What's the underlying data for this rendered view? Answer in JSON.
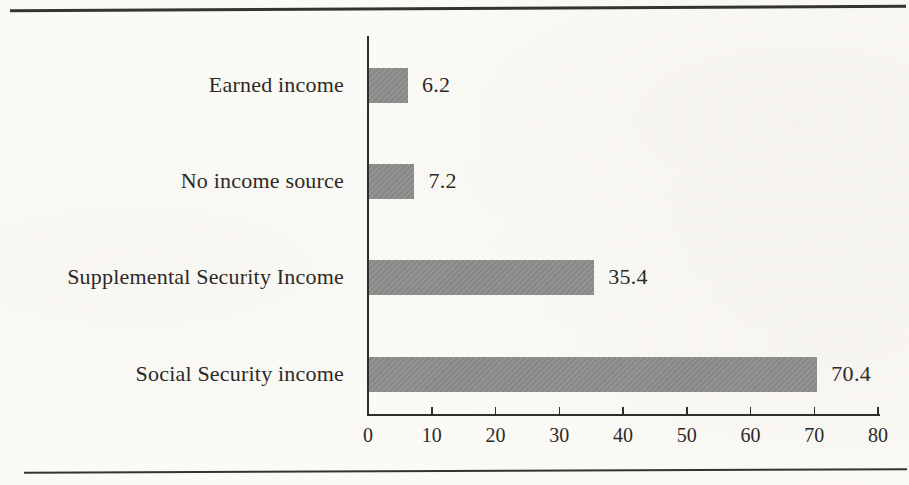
{
  "figure": {
    "paper_color": "#fcfaf6",
    "rule_color": "#35332e",
    "text_color": "#2b2a27"
  },
  "chart_data": {
    "type": "bar",
    "orientation": "horizontal",
    "categories": [
      "Earned income",
      "No income source",
      "Supplemental Security Income",
      "Social Security income"
    ],
    "values": [
      6.2,
      7.2,
      35.4,
      70.4
    ],
    "value_labels": [
      "6.2",
      "7.2",
      "35.4",
      "70.4"
    ],
    "xlim": [
      0,
      80
    ],
    "xticks": [
      0,
      10,
      20,
      30,
      40,
      50,
      60,
      70,
      80
    ],
    "xtick_labels": [
      "0",
      "10",
      "20",
      "30",
      "40",
      "50",
      "60",
      "70",
      "80"
    ],
    "grid": false,
    "legend_position": "none",
    "bar_color": "#8d8d8b",
    "axis_color": "#2f2e2b"
  }
}
